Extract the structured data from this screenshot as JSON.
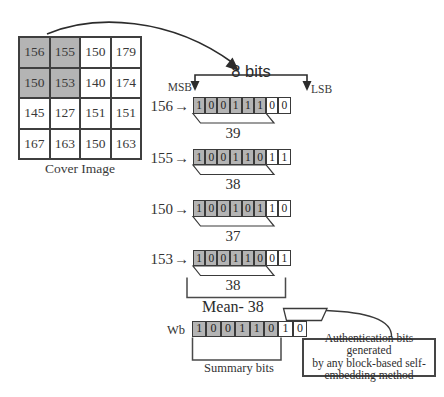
{
  "cover_image": {
    "label": "Cover Image",
    "rows": [
      [
        156,
        155,
        150,
        179
      ],
      [
        150,
        153,
        140,
        174
      ],
      [
        145,
        127,
        151,
        151
      ],
      [
        167,
        163,
        150,
        163
      ]
    ],
    "shaded_cells": [
      [
        0,
        0
      ],
      [
        0,
        1
      ],
      [
        1,
        0
      ],
      [
        1,
        1
      ]
    ]
  },
  "bit_header": {
    "span_label": "8 bits",
    "msb": "MSB",
    "lsb": "LSB"
  },
  "icons": {
    "arrow_right": "→"
  },
  "pixel_rows": [
    {
      "label": "156",
      "bits": [
        1,
        0,
        0,
        1,
        1,
        1,
        0,
        0
      ],
      "msb_count": 6,
      "value": "39"
    },
    {
      "label": "155",
      "bits": [
        1,
        0,
        0,
        1,
        1,
        0,
        1,
        1
      ],
      "msb_count": 6,
      "value": "38"
    },
    {
      "label": "150",
      "bits": [
        1,
        0,
        0,
        1,
        0,
        1,
        1,
        0
      ],
      "msb_count": 6,
      "value": "37"
    },
    {
      "label": "153",
      "bits": [
        1,
        0,
        0,
        1,
        1,
        0,
        0,
        1
      ],
      "msb_count": 6,
      "value": "38"
    }
  ],
  "mean_label": "Mean- 38",
  "summary_row": {
    "label": "Wb",
    "bits": [
      1,
      0,
      0,
      1,
      1,
      0,
      1,
      0
    ],
    "msb_count": 6,
    "caption": "Summary bits"
  },
  "callout": {
    "lines": [
      "Authentication bits generated",
      "by any block-based self-",
      "embedding method"
    ]
  },
  "colors": {
    "shaded_fill": "#b4b4b4",
    "line": "#3f3f3f",
    "ink": "#2e2e2e"
  }
}
